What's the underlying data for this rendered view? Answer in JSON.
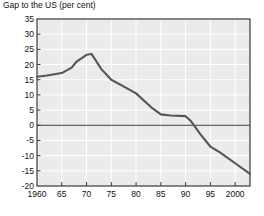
{
  "chart_data": {
    "type": "line",
    "title": "Gap to the US (per cent)",
    "xlabel": "",
    "ylabel": "",
    "ylim": [
      -20,
      35
    ],
    "xlim": [
      1960,
      2003
    ],
    "yticks": [
      35,
      30,
      25,
      20,
      15,
      10,
      5,
      0,
      -5,
      -10,
      -15,
      -20
    ],
    "ytick_labels": [
      "35",
      "30",
      "25",
      "20",
      "15",
      "10",
      "5",
      "0",
      "-5",
      "-10",
      "-15",
      "-20"
    ],
    "xticks": [
      1960,
      1965,
      1970,
      1975,
      1980,
      1985,
      1990,
      1995,
      2000
    ],
    "xtick_labels": [
      "1960",
      "65",
      "70",
      "75",
      "80",
      "85",
      "90",
      "95",
      "2000"
    ],
    "grid": true,
    "legend": null,
    "zero_line": 0,
    "series": [
      {
        "name": "Gap to the US",
        "color": "#555555",
        "x": [
          1960,
          1962,
          1965,
          1967,
          1968,
          1970,
          1971,
          1973,
          1975,
          1977,
          1980,
          1983,
          1985,
          1987,
          1990,
          1991,
          1993,
          1995,
          1997,
          2000,
          2003
        ],
        "values": [
          16.0,
          16.4,
          17.2,
          19.0,
          21.0,
          23.2,
          23.5,
          18.5,
          15.0,
          13.2,
          10.5,
          6.0,
          3.6,
          3.2,
          3.0,
          1.5,
          -3.0,
          -7.0,
          -9.0,
          -12.5,
          -16.0
        ]
      }
    ]
  },
  "colors": {
    "plot_background": "#ebebeb",
    "gridline": "#ffffff",
    "axis": "#3a3a3a",
    "line": "#555555",
    "text": "#111111"
  }
}
